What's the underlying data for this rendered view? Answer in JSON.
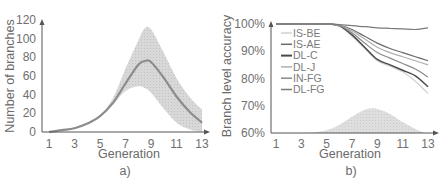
{
  "chart_data": [
    {
      "id": "a",
      "type": "line",
      "caption": "a)",
      "title": "",
      "xlabel": "Generation",
      "ylabel": "Number of branches",
      "x_ticks": [
        "1",
        "3",
        "5",
        "7",
        "9",
        "11",
        "13"
      ],
      "y_ticks": [
        "0",
        "20",
        "40",
        "60",
        "80",
        "100",
        "120"
      ],
      "xlim": [
        1,
        13
      ],
      "ylim": [
        0,
        120
      ],
      "grid": false,
      "x": [
        1,
        2,
        3,
        4,
        5,
        6,
        7,
        8,
        8.5,
        9,
        10,
        11,
        12,
        13
      ],
      "series": [
        {
          "name": "mean",
          "values": [
            0,
            2,
            4,
            9,
            17,
            31,
            52,
            72,
            76,
            75,
            58,
            38,
            22,
            10
          ]
        },
        {
          "name": "band_upper",
          "values": [
            0,
            2,
            5,
            10,
            18,
            36,
            68,
            98,
            111,
            110,
            85,
            58,
            38,
            24
          ]
        },
        {
          "name": "band_lower",
          "values": [
            0,
            2,
            4,
            8,
            16,
            29,
            44,
            49,
            47,
            42,
            25,
            10,
            3,
            0
          ]
        }
      ]
    },
    {
      "id": "b",
      "type": "line",
      "caption": "b)",
      "title": "",
      "xlabel": "Generation",
      "ylabel": "Branch level accuracy",
      "x_ticks": [
        "1",
        "3",
        "5",
        "7",
        "9",
        "11",
        "13"
      ],
      "y_ticks": [
        "60%",
        "70%",
        "80%",
        "90%",
        "100%"
      ],
      "xlim": [
        1,
        13
      ],
      "ylim": [
        60,
        100
      ],
      "grid": false,
      "legend_position": "upper-left",
      "x": [
        1,
        3,
        5,
        6,
        7,
        8,
        9,
        10,
        11,
        12,
        13
      ],
      "series": [
        {
          "name": "IS-BE",
          "color": "#d0d0d0",
          "values": [
            100,
            100,
            100,
            99.3,
            95.5,
            91,
            86.5,
            84.5,
            82.5,
            79,
            74.5
          ]
        },
        {
          "name": "IS-AE",
          "color": "#6a6a6a",
          "values": [
            100,
            100,
            100,
            99.6,
            98,
            95.5,
            93,
            91,
            89.5,
            88,
            86.5
          ]
        },
        {
          "name": "DL-C",
          "color": "#4a4a4a",
          "values": [
            100,
            100,
            100,
            99.3,
            96,
            91.5,
            87,
            85,
            83,
            81,
            77
          ]
        },
        {
          "name": "DL-J",
          "color": "#b0b0b0",
          "values": [
            100,
            100,
            100,
            99.5,
            97.5,
            94.5,
            91.5,
            89.5,
            88,
            86.5,
            85
          ]
        },
        {
          "name": "IN-FG",
          "color": "#8a8a8a",
          "values": [
            100,
            100,
            100,
            99.4,
            96.8,
            93,
            89.5,
            87.5,
            85.5,
            83.5,
            80.5
          ]
        },
        {
          "name": "DL-FG",
          "color": "#7a7a7a",
          "values": [
            100,
            100,
            100,
            99.8,
            99.4,
            99,
            98.6,
            98.4,
            98.2,
            98,
            98.6
          ]
        }
      ],
      "background_distribution": {
        "description": "shaded branch-count distribution",
        "x": [
          1,
          3,
          4,
          5,
          6,
          7,
          8,
          8.5,
          9,
          10,
          11,
          12,
          12.8
        ],
        "values": [
          60,
          60,
          60.2,
          61,
          63,
          66,
          68.5,
          69,
          68.8,
          67,
          64,
          61.5,
          60
        ]
      }
    }
  ]
}
